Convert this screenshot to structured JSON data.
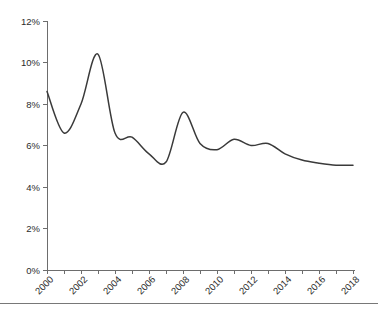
{
  "chart_data": {
    "type": "line",
    "title": "",
    "subtitle": "",
    "xlabel": "",
    "ylabel": "",
    "grid": false,
    "legend": "none",
    "xlim": [
      2000,
      2018
    ],
    "ylim": [
      0,
      12
    ],
    "y_tick_labels": [
      "0%",
      "2%",
      "4%",
      "6%",
      "8%",
      "10%",
      "12%"
    ],
    "y_tick_values": [
      0,
      2,
      4,
      6,
      8,
      10,
      12
    ],
    "x_tick_values": [
      2000,
      2001,
      2002,
      2003,
      2004,
      2005,
      2006,
      2007,
      2008,
      2009,
      2010,
      2011,
      2012,
      2013,
      2014,
      2015,
      2016,
      2017,
      2018
    ],
    "x_tick_labels": [
      "2000",
      "",
      "2002",
      "",
      "2004",
      "",
      "2006",
      "",
      "2008",
      "",
      "2010",
      "",
      "2012",
      "",
      "2014",
      "",
      "2016",
      "",
      "2018"
    ],
    "series": [
      {
        "name": "rate",
        "color": "#3a3a3a",
        "x": [
          2000,
          2001,
          2002,
          2003,
          2004,
          2005,
          2006,
          2007,
          2008,
          2009,
          2010,
          2011,
          2012,
          2013,
          2014,
          2015,
          2016,
          2017,
          2018
        ],
        "values": [
          8.6,
          6.6,
          8.0,
          10.4,
          6.6,
          6.4,
          5.6,
          5.2,
          7.6,
          6.1,
          5.8,
          6.3,
          6.0,
          6.1,
          5.6,
          5.3,
          5.15,
          5.05,
          5.05
        ]
      }
    ]
  },
  "axis": {
    "y_percent_suffix": "%",
    "color_axis": "#6d6d6d",
    "color_line": "#3a3a3a"
  },
  "footer": {
    "rule_color": "#787878"
  }
}
